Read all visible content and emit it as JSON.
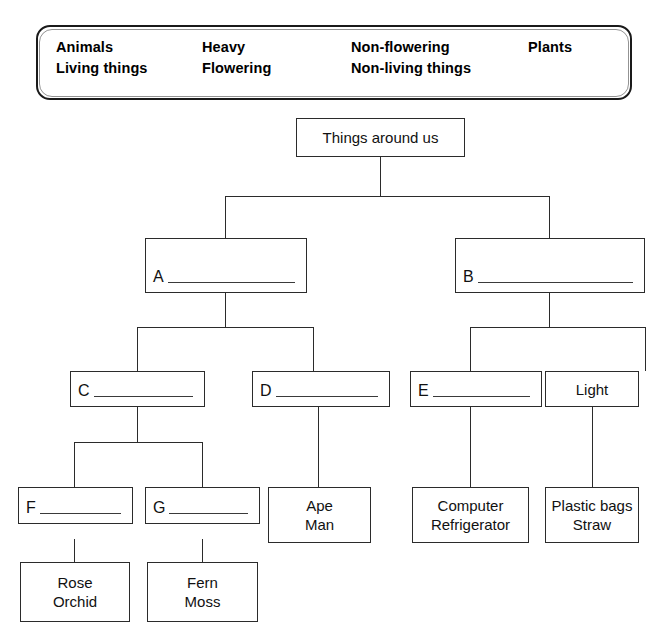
{
  "wordbank": {
    "name": "word-bank",
    "columns": [
      {
        "lines": [
          "Animals",
          "Living things"
        ]
      },
      {
        "lines": [
          "Heavy",
          "Flowering"
        ]
      },
      {
        "lines": [
          "Non-flowering",
          "Non-living things"
        ]
      },
      {
        "lines": [
          "Plants"
        ]
      }
    ]
  },
  "tree": {
    "root": {
      "label": "Things around us"
    },
    "nodes": {
      "a": {
        "letter": "A",
        "answer": ""
      },
      "b": {
        "letter": "B",
        "answer": ""
      },
      "c": {
        "letter": "C",
        "answer": ""
      },
      "d": {
        "letter": "D",
        "answer": ""
      },
      "e": {
        "letter": "E",
        "answer": ""
      },
      "f": {
        "letter": "F",
        "answer": ""
      },
      "g": {
        "letter": "G",
        "answer": ""
      },
      "light": {
        "label": "Light"
      },
      "ape_man": {
        "line1": "Ape",
        "line2": "Man"
      },
      "computer_refrigerator": {
        "line1": "Computer",
        "line2": "Refrigerator"
      },
      "plastic_straw": {
        "line1": "Plastic bags",
        "line2": "Straw"
      },
      "rose_orchid": {
        "line1": "Rose",
        "line2": "Orchid"
      },
      "fern_moss": {
        "line1": "Fern",
        "line2": "Moss"
      }
    }
  },
  "colors": {
    "ink": "#2b2b2b",
    "page": "#ffffff",
    "rule": "#3a3a3a"
  }
}
